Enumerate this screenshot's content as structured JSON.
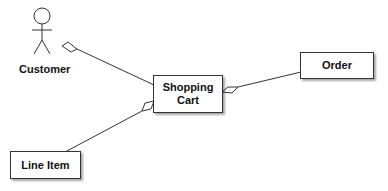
{
  "diagram": {
    "type": "uml-class-aggregation",
    "actor": {
      "label": "Customer"
    },
    "classes": [
      {
        "id": "shopping-cart",
        "label": "Shopping Cart",
        "lines": [
          "Shopping",
          "Cart"
        ]
      },
      {
        "id": "order",
        "label": "Order"
      },
      {
        "id": "line-item",
        "label": "Line Item"
      }
    ],
    "relationships": [
      {
        "from": "customer",
        "to": "shopping-cart",
        "kind": "aggregation",
        "diamond_at": "customer"
      },
      {
        "from": "shopping-cart",
        "to": "order",
        "kind": "aggregation",
        "diamond_at": "shopping-cart"
      },
      {
        "from": "shopping-cart",
        "to": "line-item",
        "kind": "aggregation",
        "diamond_at": "shopping-cart"
      }
    ],
    "colors": {
      "stroke": "#333333",
      "fill": "#ffffff",
      "text": "#111111"
    }
  }
}
